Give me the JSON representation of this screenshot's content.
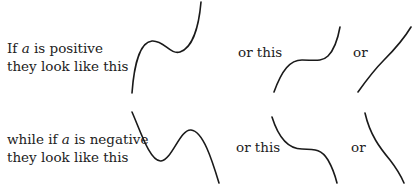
{
  "positive": {
    "line1_prefix": "If ",
    "line1_var": "a",
    "line1_suffix": " is positive",
    "line2": "they look like this",
    "or_this": "or this",
    "or": "or"
  },
  "negative": {
    "line1_prefix": "while if ",
    "line1_var": "a",
    "line1_suffix": " is negative",
    "line2": "they look like this",
    "or_this": "or this",
    "or": "or"
  },
  "curves": {
    "positive": [
      "cubic-two-turning-points",
      "cubic-stationary-inflection",
      "cubic-monotonic-increasing"
    ],
    "negative": [
      "cubic-two-turning-points",
      "cubic-stationary-inflection",
      "cubic-monotonic-decreasing"
    ]
  }
}
